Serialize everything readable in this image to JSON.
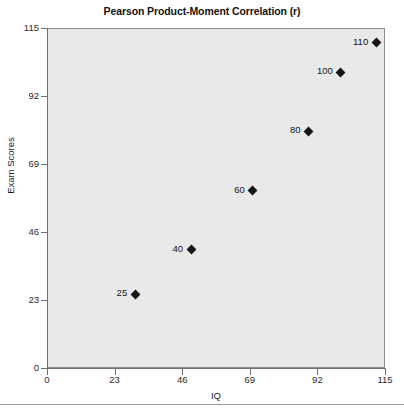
{
  "chart_data": {
    "type": "scatter",
    "title": "Pearson Product-Moment Correlation (r)",
    "xlabel": "IQ",
    "ylabel": "Exam Scores",
    "xlim": [
      0,
      115
    ],
    "ylim": [
      0,
      115
    ],
    "grid": false,
    "legend": null,
    "xticks": [
      "0",
      "23",
      "46",
      "69",
      "92",
      "115"
    ],
    "yticks": [
      "0",
      "23",
      "46",
      "69",
      "92",
      "115"
    ],
    "xtick_values": [
      0,
      23,
      46,
      69,
      92,
      115
    ],
    "ytick_values": [
      0,
      23,
      46,
      69,
      92,
      115
    ],
    "marker": "diamond",
    "marker_color": "#161616",
    "plot_background": "#e9e9e9",
    "points": [
      {
        "x": 30,
        "y": 25,
        "label": "25"
      },
      {
        "x": 49,
        "y": 40,
        "label": "40"
      },
      {
        "x": 70,
        "y": 60,
        "label": "60"
      },
      {
        "x": 89,
        "y": 80,
        "label": "80"
      },
      {
        "x": 100,
        "y": 100,
        "label": "100"
      },
      {
        "x": 112,
        "y": 110,
        "label": "110"
      }
    ]
  }
}
